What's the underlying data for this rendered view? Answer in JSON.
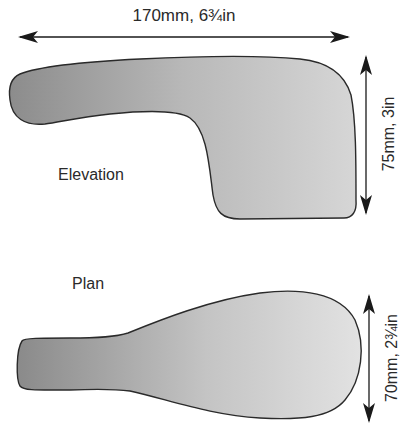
{
  "diagram": {
    "width_dimension": "170mm, 6¾in",
    "elevation_height_dimension": "75mm, 3in",
    "plan_width_dimension": "70mm, 2¾in",
    "elevation_label": "Elevation",
    "plan_label": "Plan"
  },
  "colors": {
    "shape_dark": "#8a8a8a",
    "shape_light": "#d8d8d8",
    "outline": "#2a2a2a",
    "arrow": "#1a1a1a",
    "text": "#2a2a2a"
  }
}
